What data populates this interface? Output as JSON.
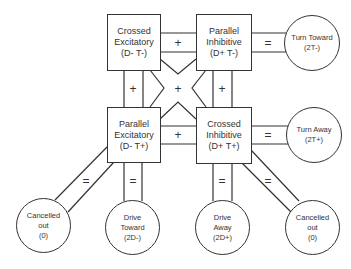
{
  "boxes": [
    {
      "id": "crossed-excitatory",
      "line1": "Crossed",
      "line2": "Excitatory",
      "line3": "(D- T-)"
    },
    {
      "id": "parallel-inhibitive",
      "line1": "Parallel",
      "line2": "Inhibitive",
      "line3": "(D+ T-)"
    },
    {
      "id": "parallel-excitatory",
      "line1": "Parallel",
      "line2": "Excitatory",
      "line3": "(D- T+)"
    },
    {
      "id": "crossed-inhibitive",
      "line1": "Crossed",
      "line2": "Inhibitive",
      "line3": "(D+ T+)"
    }
  ],
  "outcomes": [
    {
      "id": "turn-toward",
      "line1": "Turn Toward",
      "line2": "(2T-)",
      "line3": ""
    },
    {
      "id": "turn-away",
      "line1": "Turn Away",
      "line2": "(2T+)",
      "line3": ""
    },
    {
      "id": "cancelled-out-left",
      "line1": "Cancelled",
      "line2": "out",
      "line3": "(0)"
    },
    {
      "id": "drive-toward",
      "line1": "Drive",
      "line2": "Toward",
      "line3": "(2D-)"
    },
    {
      "id": "drive-away",
      "line1": "Drive",
      "line2": "Away",
      "line3": "(2D+)"
    },
    {
      "id": "cancelled-out-right",
      "line1": "Cancelled",
      "line2": "out",
      "line3": "(0)"
    }
  ],
  "symbols": {
    "plus": "+",
    "equals": "="
  }
}
